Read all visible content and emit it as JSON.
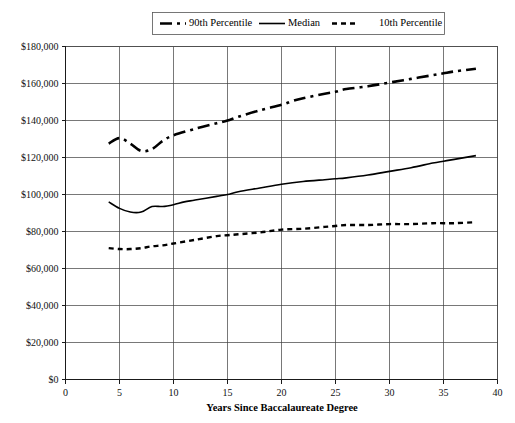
{
  "chart_data": {
    "type": "line",
    "title": "",
    "xlabel": "Years Since Baccalaureate Degree",
    "ylabel": "",
    "xlim": [
      0,
      40
    ],
    "ylim": [
      0,
      180000
    ],
    "grid": true,
    "legend_position": "top",
    "x_ticks": [
      "0",
      "5",
      "10",
      "15",
      "20",
      "25",
      "30",
      "35",
      "40"
    ],
    "x_tick_values": [
      0,
      5,
      10,
      15,
      20,
      25,
      30,
      35,
      40
    ],
    "y_ticks": [
      "$0",
      "$20,000",
      "$40,000",
      "$60,000",
      "$80,000",
      "$100,000",
      "$120,000",
      "$140,000",
      "$160,000",
      "$180,000"
    ],
    "y_tick_values": [
      0,
      20000,
      40000,
      60000,
      80000,
      100000,
      120000,
      140000,
      160000,
      180000
    ],
    "series": [
      {
        "name": "90th Percentile",
        "dash": "12,5,3,5",
        "width": 2.6,
        "x": [
          4,
          5,
          6,
          7,
          8,
          9,
          10,
          12,
          14,
          15,
          16,
          18,
          20,
          21,
          22,
          24,
          25,
          26,
          28,
          30,
          32,
          34,
          35,
          36,
          38
        ],
        "values": [
          127500,
          130500,
          127500,
          123500,
          124500,
          129000,
          132000,
          135500,
          138500,
          140000,
          142000,
          145500,
          148500,
          150500,
          152000,
          154500,
          155500,
          157000,
          158500,
          160500,
          162500,
          164500,
          165500,
          166500,
          168000
        ]
      },
      {
        "name": "Median",
        "dash": "",
        "width": 1.6,
        "x": [
          4,
          5,
          6,
          7,
          8,
          9,
          10,
          11,
          12,
          14,
          15,
          16,
          18,
          20,
          22,
          24,
          25,
          26,
          28,
          30,
          32,
          34,
          35,
          36,
          38
        ],
        "values": [
          96000,
          92500,
          90500,
          90500,
          93500,
          93500,
          94500,
          96000,
          97000,
          99000,
          100000,
          101500,
          103500,
          105500,
          107000,
          108000,
          108500,
          109000,
          110500,
          112500,
          114500,
          117000,
          118000,
          119000,
          121000
        ]
      },
      {
        "name": "10th Percentile",
        "dash": "5,4",
        "width": 2.4,
        "x": [
          4,
          5,
          6,
          7,
          8,
          9,
          10,
          12,
          14,
          15,
          16,
          18,
          20,
          22,
          24,
          25,
          26,
          28,
          30,
          32,
          34,
          35,
          36,
          38
        ],
        "values": [
          71000,
          70500,
          70500,
          71000,
          72000,
          72500,
          73500,
          75500,
          77500,
          78000,
          78500,
          79500,
          81000,
          81500,
          82500,
          83000,
          83500,
          83500,
          84000,
          84000,
          84500,
          84500,
          84500,
          85000
        ]
      }
    ]
  },
  "legend": {
    "items": [
      {
        "label": "90th Percentile"
      },
      {
        "label": "Median"
      },
      {
        "label": "10th Percentile"
      }
    ]
  }
}
